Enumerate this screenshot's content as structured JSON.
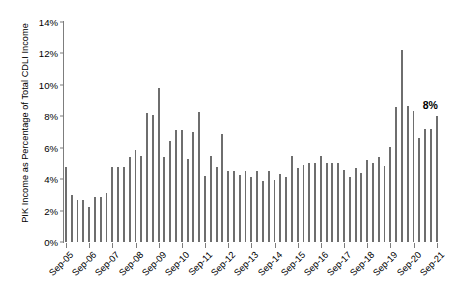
{
  "chart_data": {
    "type": "bar",
    "title": "",
    "subtitle": "",
    "xlabel": "",
    "ylabel": "PIK Income as Percentage of Total CDLI Income",
    "ylim": [
      0,
      14
    ],
    "ytick_labels": [
      "0%",
      "2%",
      "4%",
      "6%",
      "8%",
      "10%",
      "12%",
      "14%"
    ],
    "ytick_values": [
      0,
      2,
      4,
      6,
      8,
      10,
      12,
      14
    ],
    "grid": false,
    "legend": null,
    "frequency": "quarterly",
    "x_tick_labels": [
      "Sep-05",
      "Sep-06",
      "Sep-07",
      "Sep-08",
      "Sep-09",
      "Sep-10",
      "Sep-11",
      "Sep-12",
      "Sep-13",
      "Sep-14",
      "Sep-15",
      "Sep-16",
      "Sep-17",
      "Sep-18",
      "Sep-19",
      "Sep-20",
      "Sep-21"
    ],
    "x_tick_indices": [
      0,
      4,
      8,
      12,
      16,
      20,
      24,
      28,
      32,
      36,
      40,
      44,
      48,
      52,
      56,
      60,
      64
    ],
    "categories": [
      "Sep-05",
      "Dec-05",
      "Mar-06",
      "Jun-06",
      "Sep-06",
      "Dec-06",
      "Mar-07",
      "Jun-07",
      "Sep-07",
      "Dec-07",
      "Mar-08",
      "Jun-08",
      "Sep-08",
      "Dec-08",
      "Mar-09",
      "Jun-09",
      "Sep-09",
      "Dec-09",
      "Mar-10",
      "Jun-10",
      "Sep-10",
      "Dec-10",
      "Mar-11",
      "Jun-11",
      "Sep-11",
      "Dec-11",
      "Mar-12",
      "Jun-12",
      "Sep-12",
      "Dec-12",
      "Mar-13",
      "Jun-13",
      "Sep-13",
      "Dec-13",
      "Mar-14",
      "Jun-14",
      "Sep-14",
      "Dec-14",
      "Mar-15",
      "Jun-15",
      "Sep-15",
      "Dec-15",
      "Mar-16",
      "Jun-16",
      "Sep-16",
      "Dec-16",
      "Mar-17",
      "Jun-17",
      "Sep-17",
      "Dec-17",
      "Mar-18",
      "Jun-18",
      "Sep-18",
      "Dec-18",
      "Mar-19",
      "Jun-19",
      "Sep-19",
      "Dec-19",
      "Mar-20",
      "Jun-20",
      "Sep-20",
      "Dec-20",
      "Mar-21",
      "Jun-21",
      "Sep-21"
    ],
    "values": [
      4.75,
      3.0,
      2.7,
      2.7,
      2.2,
      2.85,
      2.85,
      3.1,
      4.8,
      4.8,
      4.75,
      5.4,
      5.85,
      5.5,
      8.2,
      8.1,
      9.8,
      5.4,
      6.4,
      7.1,
      7.15,
      5.3,
      7.0,
      8.3,
      4.2,
      5.45,
      4.8,
      6.9,
      4.5,
      4.5,
      4.25,
      4.5,
      4.15,
      4.55,
      3.9,
      4.55,
      3.95,
      4.35,
      4.15,
      5.45,
      4.7,
      4.9,
      5.0,
      5.0,
      5.5,
      5.0,
      5.0,
      5.0,
      4.6,
      4.15,
      4.7,
      4.4,
      5.2,
      5.0,
      5.4,
      4.85,
      6.05,
      8.6,
      12.2,
      8.65,
      8.35,
      6.6,
      7.2,
      7.2,
      8.0
    ],
    "annotations": [
      {
        "text": "8%",
        "category": "Sep-21",
        "value": 8.0
      }
    ],
    "bar_color": "#6e6e6e",
    "axis_color": "#7d7d7d"
  }
}
